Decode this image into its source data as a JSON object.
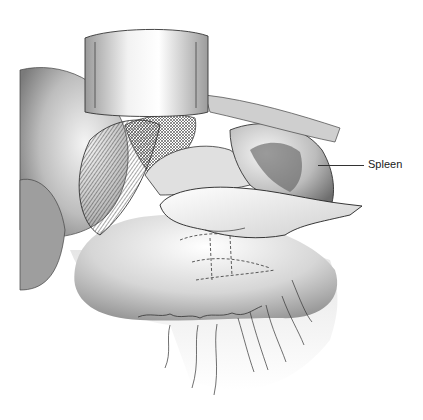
{
  "figure": {
    "type": "surgical illustration",
    "style": "grayscale pen-and-ink with airbrushed shading",
    "labels": [
      {
        "text": "Spleen",
        "x": 368,
        "y": 158,
        "leader_from_x": 318,
        "leader_to_x": 364,
        "leader_y": 165
      }
    ]
  },
  "colors": {
    "background": "#ffffff",
    "ink": "#1a1a1a",
    "shade_dark": "#8a8a8a",
    "shade_mid": "#c4c4c4",
    "shade_light": "#ececec"
  }
}
